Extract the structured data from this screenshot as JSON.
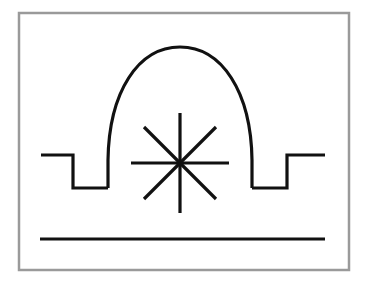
{
  "figure": {
    "canvas": {
      "width": 368,
      "height": 287,
      "background": "#ffffff"
    },
    "frame": {
      "name": "outer-border",
      "x": 19,
      "y": 13,
      "width": 330,
      "height": 257,
      "stroke_color": "#9a9a9a",
      "stroke_width": 2.5,
      "fill": "none"
    },
    "ink_color": "#111111",
    "stroke_width": 3.2,
    "shapes": {
      "arch": {
        "name": "arch-dome-curve",
        "apex_x": 180,
        "apex_y": 47,
        "left_foot_x": 108,
        "right_foot_x": 252,
        "foot_y": 188,
        "path": "M 108 188 L 108 160 C 109 92 138 47 180 47 C 222 47 251 92 252 160 L 252 188"
      },
      "left_step": {
        "name": "left-step-profile",
        "path": "M 41 155 L 73 155 L 73 188 L 108 188",
        "outer_x": 41,
        "top_y": 155,
        "riser_x": 73,
        "bottom_y": 188,
        "inner_x": 108
      },
      "right_step": {
        "name": "right-step-profile",
        "path": "M 252 188 L 287 188 L 287 155 L 325 155",
        "inner_x": 252,
        "bottom_y": 188,
        "riser_x": 287,
        "top_y": 155,
        "outer_x": 325
      },
      "starburst": {
        "name": "starburst-asterisk",
        "center_x": 180,
        "center_y": 163,
        "ray_count": 8,
        "vertical_half_length": 50,
        "horizontal_half_length": 49,
        "diagonal_half_length": 50,
        "rays": [
          {
            "name": "ray-vertical",
            "x1": 180,
            "y1": 113,
            "x2": 180,
            "y2": 213
          },
          {
            "name": "ray-horizontal",
            "x1": 131,
            "y1": 163,
            "x2": 229,
            "y2": 163
          },
          {
            "name": "ray-diagonal-nw-se",
            "x1": 144,
            "y1": 127,
            "x2": 216,
            "y2": 199
          },
          {
            "name": "ray-diagonal-ne-sw",
            "x1": 216,
            "y1": 127,
            "x2": 144,
            "y2": 199
          }
        ]
      },
      "baseline": {
        "name": "bottom-baseline",
        "x1": 40,
        "y1": 239,
        "x2": 325,
        "y2": 239
      }
    }
  }
}
